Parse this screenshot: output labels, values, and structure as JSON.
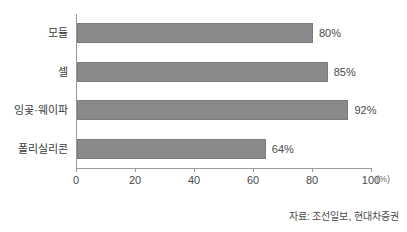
{
  "chart_data": {
    "type": "bar",
    "orientation": "horizontal",
    "title": "",
    "subtitle": "",
    "xlabel": "",
    "ylabel": "",
    "unit_label": "(%)",
    "categories": [
      "모듈",
      "셀",
      "잉곷·웨이파",
      "폴리실리콘"
    ],
    "values": [
      80,
      85,
      92,
      64
    ],
    "data_labels": [
      "80%",
      "85%",
      "92%",
      "64%"
    ],
    "xlim": [
      0,
      100
    ],
    "xticks": [
      0,
      20,
      40,
      60,
      80,
      100
    ],
    "xtick_labels": [
      "0",
      "20",
      "40",
      "60",
      "80",
      "100"
    ],
    "grid": false,
    "legend": false,
    "bar_color": "#8a8a8a",
    "bar_edge_color": "#7b7b7b",
    "axis_color": "#9a9a9a",
    "text_color": "#3c3c3c",
    "background_color": "#ffffff"
  },
  "source": {
    "note": "자료: 조선일보, 현대차증권"
  }
}
